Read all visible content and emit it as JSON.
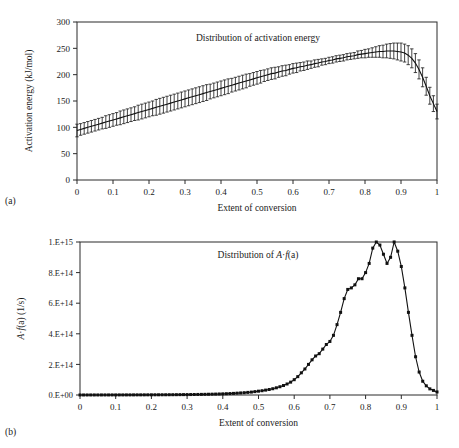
{
  "figure": {
    "panel_a_caption": "(a)",
    "panel_b_caption": "(b)"
  },
  "chart_data": [
    {
      "id": "panel-a",
      "type": "line",
      "title": "Distribution of activation energy",
      "xlabel": "Extent of conversion",
      "ylabel": "Activation energy (kJ/mol)",
      "xlim": [
        0,
        1
      ],
      "ylim": [
        0,
        300
      ],
      "xticks": [
        0,
        0.1,
        0.2,
        0.3,
        0.4,
        0.5,
        0.6,
        0.7,
        0.8,
        0.9,
        1
      ],
      "xticklabels": [
        "0",
        "0.1",
        "0.2",
        "0.3",
        "0.4",
        "0.5",
        "0.6",
        "0.7",
        "0.8",
        "0.9",
        "1"
      ],
      "yticks": [
        0,
        50,
        100,
        150,
        200,
        250,
        300
      ],
      "yticklabels": [
        "0",
        "50",
        "100",
        "150",
        "200",
        "250",
        "300"
      ],
      "grid": false,
      "legend": "none",
      "error_bars": true,
      "x": [
        0.0,
        0.01,
        0.02,
        0.03,
        0.04,
        0.05,
        0.06,
        0.07,
        0.08,
        0.09,
        0.1,
        0.11,
        0.12,
        0.13,
        0.14,
        0.15,
        0.16,
        0.17,
        0.18,
        0.19,
        0.2,
        0.21,
        0.22,
        0.23,
        0.24,
        0.25,
        0.26,
        0.27,
        0.28,
        0.29,
        0.3,
        0.31,
        0.32,
        0.33,
        0.34,
        0.35,
        0.36,
        0.37,
        0.38,
        0.39,
        0.4,
        0.41,
        0.42,
        0.43,
        0.44,
        0.45,
        0.46,
        0.47,
        0.48,
        0.49,
        0.5,
        0.51,
        0.52,
        0.53,
        0.54,
        0.55,
        0.56,
        0.57,
        0.58,
        0.59,
        0.6,
        0.61,
        0.62,
        0.63,
        0.64,
        0.65,
        0.66,
        0.67,
        0.68,
        0.69,
        0.7,
        0.71,
        0.72,
        0.73,
        0.74,
        0.75,
        0.76,
        0.77,
        0.78,
        0.79,
        0.8,
        0.81,
        0.82,
        0.83,
        0.84,
        0.85,
        0.86,
        0.87,
        0.88,
        0.89,
        0.9,
        0.91,
        0.92,
        0.93,
        0.94,
        0.95,
        0.96,
        0.97,
        0.98,
        0.99,
        1.0
      ],
      "y": [
        94,
        96,
        98,
        100,
        102,
        104,
        106,
        108,
        110,
        112,
        114,
        116,
        118,
        120,
        122,
        124,
        126,
        128,
        130,
        132,
        134,
        136,
        138,
        140,
        142,
        144,
        146,
        148,
        150,
        152,
        154,
        156,
        158,
        160,
        162,
        164,
        166,
        168,
        170,
        172,
        174,
        176,
        178,
        180,
        182,
        184,
        186,
        188,
        190,
        192,
        194,
        196,
        198,
        200,
        202,
        203,
        205,
        207,
        208,
        210,
        212,
        213,
        215,
        216,
        218,
        219,
        221,
        222,
        224,
        225,
        227,
        228,
        230,
        231,
        232,
        234,
        235,
        236,
        238,
        239,
        240,
        241,
        242,
        243,
        244,
        244,
        245,
        245,
        245,
        244,
        243,
        241,
        237,
        231,
        222,
        210,
        195,
        178,
        160,
        145,
        130
      ],
      "yerr": [
        12,
        11,
        11,
        11,
        11,
        11,
        11,
        11,
        12,
        12,
        12,
        12,
        13,
        13,
        13,
        13,
        13,
        14,
        14,
        14,
        14,
        14,
        15,
        15,
        15,
        15,
        15,
        15,
        15,
        15,
        15,
        15,
        15,
        15,
        15,
        15,
        15,
        14,
        14,
        14,
        14,
        14,
        14,
        13,
        13,
        13,
        13,
        13,
        12,
        12,
        12,
        12,
        11,
        11,
        11,
        11,
        10,
        10,
        10,
        9,
        9,
        9,
        8,
        8,
        8,
        7,
        7,
        7,
        6,
        6,
        6,
        6,
        6,
        6,
        6,
        6,
        6,
        6,
        7,
        7,
        8,
        8,
        9,
        10,
        11,
        12,
        13,
        14,
        15,
        16,
        17,
        17,
        18,
        18,
        18,
        18,
        18,
        17,
        16,
        15,
        14
      ]
    },
    {
      "id": "panel-b",
      "type": "line",
      "title": "Distribution of A·f(a)",
      "title_parts": [
        "Distribution of ",
        "A",
        "·",
        "f",
        "(a)"
      ],
      "xlabel": "Extent of conversion",
      "ylabel": "A·f(a) (1/s)",
      "xlim": [
        0,
        1
      ],
      "ylim": [
        0,
        1000000000000000.0
      ],
      "xticks": [
        0,
        0.1,
        0.2,
        0.3,
        0.4,
        0.5,
        0.6,
        0.7,
        0.8,
        0.9,
        1
      ],
      "xticklabels": [
        "0",
        "0.1",
        "0.2",
        "0.3",
        "0.4",
        "0.5",
        "0.6",
        "0.7",
        "0.8",
        "0.9",
        "1"
      ],
      "yticks": [
        0,
        200000000000000.0,
        400000000000000.0,
        600000000000000.0,
        800000000000000.0,
        1000000000000000.0
      ],
      "yticklabels": [
        "0.E+00",
        "2.E+14",
        "4.E+14",
        "6.E+14",
        "8.E+14",
        "1.E+15"
      ],
      "grid": false,
      "legend": "none",
      "markers": "filled-square",
      "x": [
        0.0,
        0.01,
        0.02,
        0.03,
        0.04,
        0.05,
        0.06,
        0.07,
        0.08,
        0.09,
        0.1,
        0.11,
        0.12,
        0.13,
        0.14,
        0.15,
        0.16,
        0.17,
        0.18,
        0.19,
        0.2,
        0.21,
        0.22,
        0.23,
        0.24,
        0.25,
        0.26,
        0.27,
        0.28,
        0.29,
        0.3,
        0.31,
        0.32,
        0.33,
        0.34,
        0.35,
        0.36,
        0.37,
        0.38,
        0.39,
        0.4,
        0.41,
        0.42,
        0.43,
        0.44,
        0.45,
        0.46,
        0.47,
        0.48,
        0.49,
        0.5,
        0.51,
        0.52,
        0.53,
        0.54,
        0.55,
        0.56,
        0.57,
        0.58,
        0.59,
        0.6,
        0.61,
        0.62,
        0.63,
        0.64,
        0.65,
        0.66,
        0.67,
        0.68,
        0.69,
        0.7,
        0.71,
        0.72,
        0.73,
        0.74,
        0.75,
        0.76,
        0.77,
        0.78,
        0.79,
        0.8,
        0.81,
        0.82,
        0.83,
        0.84,
        0.85,
        0.86,
        0.87,
        0.88,
        0.89,
        0.9,
        0.91,
        0.92,
        0.93,
        0.94,
        0.95,
        0.96,
        0.97,
        0.98,
        0.99,
        1.0
      ],
      "y": [
        200000000000.0,
        200000000000.0,
        200000000000.0,
        300000000000.0,
        300000000000.0,
        300000000000.0,
        400000000000.0,
        400000000000.0,
        400000000000.0,
        500000000000.0,
        500000000000.0,
        600000000000.0,
        600000000000.0,
        700000000000.0,
        700000000000.0,
        800000000000.0,
        900000000000.0,
        900000000000.0,
        1000000000000.0,
        1100000000000.0,
        1200000000000.0,
        1300000000000.0,
        1400000000000.0,
        1500000000000.0,
        1600000000000.0,
        1800000000000.0,
        1900000000000.0,
        2100000000000.0,
        2300000000000.0,
        2500000000000.0,
        2700000000000.0,
        3000000000000.0,
        3300000000000.0,
        3600000000000.0,
        4000000000000.0,
        4400000000000.0,
        4900000000000.0,
        5400000000000.0,
        6000000000000.0,
        6700000000000.0,
        7500000000000.0,
        8400000000000.0,
        9400000000000.0,
        10500000000000.0,
        12000000000000.0,
        13500000000000.0,
        15000000000000.0,
        17000000000000.0,
        19000000000000.0,
        22000000000000.0,
        25000000000000.0,
        28000000000000.0,
        32000000000000.0,
        36000000000000.0,
        41000000000000.0,
        47000000000000.0,
        54000000000000.0,
        62000000000000.0,
        72000000000000.0,
        84000000000000.0,
        100000000000000.0,
        120000000000000.0,
        145000000000000.0,
        170000000000000.0,
        200000000000000.0,
        230000000000000.0,
        255000000000000.0,
        270000000000000.0,
        300000000000000.0,
        330000000000000.0,
        350000000000000.0,
        390000000000000.0,
        460000000000000.0,
        540000000000000.0,
        630000000000000.0,
        690000000000000.0,
        700000000000000.0,
        720000000000000.0,
        760000000000000.0,
        760000000000000.0,
        800000000000000.0,
        860000000000000.0,
        960000000000000.0,
        1000000000000000.0,
        980000000000000.0,
        920000000000000.0,
        860000000000000.0,
        900000000000000.0,
        1000000000000000.0,
        940000000000000.0,
        840000000000000.0,
        700000000000000.0,
        540000000000000.0,
        390000000000000.0,
        250000000000000.0,
        150000000000000.0,
        90000000000000.0,
        60000000000000.0,
        40000000000000.0,
        30000000000000.0,
        20000000000000.0
      ],
      "y_scaled_note": "values plotted against ylim 0 to 1.E+15",
      "peaks": [
        {
          "x": 0.825,
          "y": 870000000000000.0,
          "label": "main peak"
        },
        {
          "x": 0.858,
          "y": 650000000000000.0,
          "label": "dip"
        },
        {
          "x": 0.875,
          "y": 740000000000000.0,
          "label": "secondary peak"
        }
      ]
    }
  ]
}
